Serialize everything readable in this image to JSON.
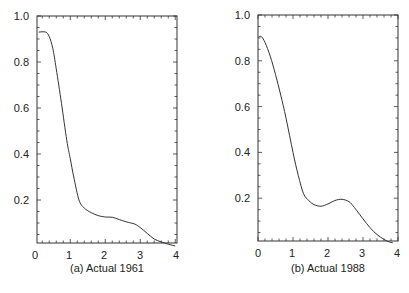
{
  "chart_data": [
    {
      "type": "line",
      "title": "",
      "caption": "(a) Actual 1961",
      "xlabel": "",
      "ylabel": "",
      "xlim": [
        0,
        4
      ],
      "ylim": [
        0,
        1.0
      ],
      "xticks": [
        "0",
        "1",
        "2",
        "3",
        "4"
      ],
      "yticks": [
        "0.2",
        "0.4",
        "0.6",
        "0.8",
        "1.0"
      ],
      "grid": false,
      "legend": null,
      "series": [
        {
          "name": "1961",
          "x": [
            0.1,
            0.3,
            0.4,
            0.5,
            0.6,
            0.75,
            0.9,
            1.0,
            1.1,
            1.25,
            1.4,
            1.6,
            1.8,
            2.0,
            2.2,
            2.4,
            2.6,
            2.85,
            3.0,
            3.2,
            3.4,
            3.6,
            3.8,
            4.0
          ],
          "y": [
            0.93,
            0.93,
            0.91,
            0.86,
            0.77,
            0.62,
            0.46,
            0.38,
            0.3,
            0.2,
            0.165,
            0.145,
            0.132,
            0.126,
            0.125,
            0.115,
            0.105,
            0.095,
            0.08,
            0.055,
            0.03,
            0.018,
            0.008,
            0.0
          ]
        }
      ]
    },
    {
      "type": "line",
      "title": "",
      "caption": "(b) Actual 1988",
      "xlabel": "",
      "ylabel": "",
      "xlim": [
        0,
        4
      ],
      "ylim": [
        0,
        1.0
      ],
      "xticks": [
        "0",
        "1",
        "2",
        "3",
        "4"
      ],
      "yticks": [
        "0.2",
        "0.4",
        "0.6",
        "0.8",
        "1.0"
      ],
      "grid": false,
      "legend": null,
      "series": [
        {
          "name": "1988",
          "x": [
            0.02,
            0.1,
            0.2,
            0.35,
            0.5,
            0.65,
            0.8,
            1.0,
            1.15,
            1.3,
            1.45,
            1.6,
            1.8,
            2.0,
            2.2,
            2.4,
            2.6,
            2.75,
            2.9,
            3.1,
            3.3,
            3.5,
            3.7,
            3.85
          ],
          "y": [
            0.905,
            0.905,
            0.88,
            0.82,
            0.74,
            0.65,
            0.55,
            0.4,
            0.3,
            0.22,
            0.19,
            0.172,
            0.165,
            0.175,
            0.19,
            0.195,
            0.185,
            0.16,
            0.13,
            0.09,
            0.055,
            0.03,
            0.012,
            0.005
          ]
        }
      ]
    }
  ]
}
